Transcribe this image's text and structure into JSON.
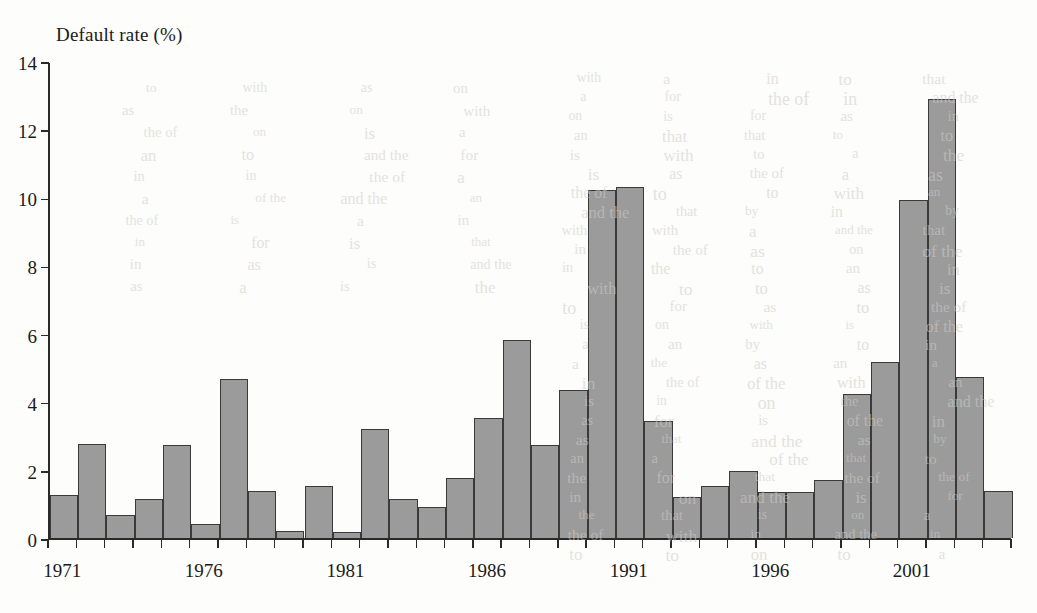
{
  "figure": {
    "y_axis_title": "Default rate (%)",
    "y_ticks": [
      "0",
      "2",
      "4",
      "6",
      "8",
      "10",
      "12",
      "14"
    ],
    "x_labels": [
      "1971",
      "1976",
      "1981",
      "1986",
      "1991",
      "1996",
      "2001"
    ],
    "bar_fill_color": "#9b9b9b",
    "bar_edge_color": "#3a3a3a",
    "axis_color": "#2a2a2a"
  },
  "background_text": {
    "lines": [
      "the of",
      "in",
      "and the",
      "a",
      "the",
      "of the",
      "to",
      "with",
      "for",
      "that",
      "on",
      "as",
      "by",
      "an",
      "is"
    ]
  },
  "chart_data": {
    "type": "bar",
    "title": "",
    "subtitle": "",
    "xlabel": "",
    "ylabel": "Default rate (%)",
    "ylim": [
      0,
      14
    ],
    "ytick_values": [
      0,
      2,
      4,
      6,
      8,
      10,
      12,
      14
    ],
    "grid": false,
    "legend": null,
    "categories": [
      "1971",
      "1972",
      "1973",
      "1974",
      "1975",
      "1976",
      "1977",
      "1978",
      "1979",
      "1980",
      "1981",
      "1982",
      "1983",
      "1984",
      "1985",
      "1986",
      "1987",
      "1988",
      "1989",
      "1990",
      "1991",
      "1992",
      "1993",
      "1994",
      "1995",
      "1996",
      "1997",
      "1998",
      "1999",
      "2000",
      "2001",
      "2002",
      "2003",
      "2004"
    ],
    "values": [
      1.27,
      2.78,
      0.68,
      1.17,
      2.75,
      0.43,
      4.67,
      1.38,
      0.22,
      1.55,
      0.18,
      3.2,
      1.17,
      0.92,
      1.77,
      3.53,
      5.82,
      2.73,
      4.37,
      10.22,
      10.32,
      3.45,
      1.22,
      1.55,
      1.97,
      1.35,
      1.35,
      1.72,
      4.23,
      5.17,
      9.92,
      12.9,
      4.75,
      1.38
    ],
    "labeled_xticks": {
      "1971": 1971,
      "1976": 1976,
      "1981": 1981,
      "1986": 1986,
      "1991": 1991,
      "1996": 1996,
      "2001": 2001
    },
    "note": "Final bar at far right (2004) is 3.20"
  }
}
